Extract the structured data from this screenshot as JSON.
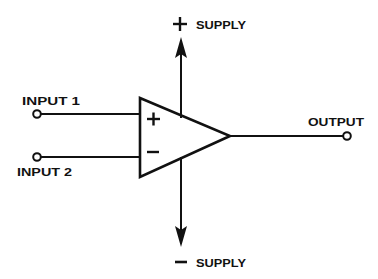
{
  "diagram": {
    "type": "op-amp symbol",
    "colors": {
      "stroke": "#111111",
      "background": "#ffffff"
    },
    "labels": {
      "input1": "INPUT 1",
      "input2": "INPUT 2",
      "output": "OUTPUT",
      "plus_supply": "SUPPLY",
      "minus_supply": "SUPPLY",
      "plus_sign": "+",
      "minus_sign": "−",
      "noninverting_symbol": "+",
      "inverting_symbol": "−"
    }
  }
}
